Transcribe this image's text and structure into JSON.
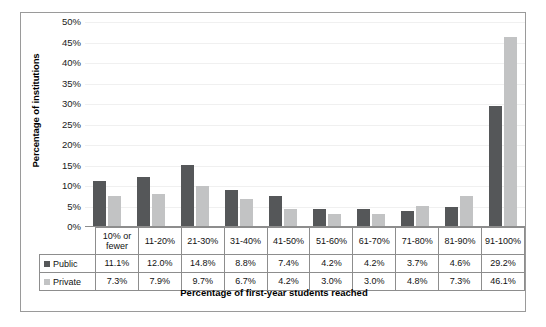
{
  "chart_data": {
    "type": "bar",
    "title": "",
    "xlabel": "Percentage of first-year students reached",
    "ylabel": "Percentage of institutions",
    "categories": [
      "10% or fewer",
      "11-20%",
      "21-30%",
      "31-40%",
      "41-50%",
      "51-60%",
      "61-70%",
      "71-80%",
      "81-90%",
      "91-100%"
    ],
    "series": [
      {
        "name": "Public",
        "color": "#555759",
        "values": [
          11.1,
          12.0,
          14.8,
          8.8,
          7.4,
          4.2,
          4.2,
          3.7,
          4.6,
          29.2
        ],
        "labels": [
          "11.1%",
          "12.0%",
          "14.8%",
          "8.8%",
          "7.4%",
          "4.2%",
          "4.2%",
          "3.7%",
          "4.6%",
          "29.2%"
        ]
      },
      {
        "name": "Private",
        "color": "#c2c3c4",
        "values": [
          7.3,
          7.9,
          9.7,
          6.7,
          4.2,
          3.0,
          3.0,
          4.8,
          7.3,
          46.1
        ],
        "labels": [
          "7.3%",
          "7.9%",
          "9.7%",
          "6.7%",
          "4.2%",
          "3.0%",
          "3.0%",
          "4.8%",
          "7.3%",
          "46.1%"
        ]
      }
    ],
    "ylim": [
      0,
      50
    ],
    "ytick_labels": [
      "50%",
      "45%",
      "40%",
      "35%",
      "30%",
      "25%",
      "20%",
      "15%",
      "10%",
      "5%",
      "0%"
    ],
    "ytick_values": [
      50,
      45,
      40,
      35,
      30,
      25,
      20,
      15,
      10,
      5,
      0
    ],
    "grid": true,
    "legend_position": "data-table-row-headers"
  }
}
